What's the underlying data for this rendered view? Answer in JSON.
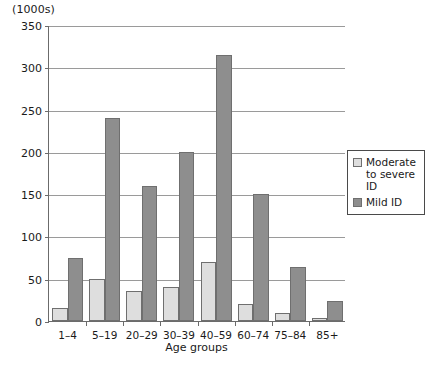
{
  "units_label": "(1000s)",
  "chart_data": {
    "type": "bar",
    "title": "",
    "xlabel": "Age groups",
    "ylabel": "(1000s)",
    "categories": [
      "1–4",
      "5–19",
      "20–29",
      "30–39",
      "40–59",
      "60–74",
      "75–84",
      "85+"
    ],
    "series": [
      {
        "name": "Moderate to severe ID",
        "color": "#dedede",
        "values": [
          15,
          50,
          35,
          40,
          70,
          20,
          10,
          4
        ]
      },
      {
        "name": "Mild ID",
        "color": "#8e8e8e",
        "values": [
          75,
          240,
          160,
          200,
          315,
          150,
          64,
          24
        ]
      }
    ],
    "ylim": [
      0,
      350
    ],
    "yticks": [
      0,
      50,
      100,
      150,
      200,
      250,
      300,
      350
    ],
    "ytick_labels": [
      "0",
      "50",
      "100",
      "150",
      "200",
      "250",
      "300",
      "350"
    ],
    "grid": true,
    "legend_position": "right"
  },
  "legend": {
    "items": [
      {
        "label": "Moderate to severe ID",
        "swatch": "light"
      },
      {
        "label": "Mild ID",
        "swatch": "dark"
      }
    ]
  }
}
